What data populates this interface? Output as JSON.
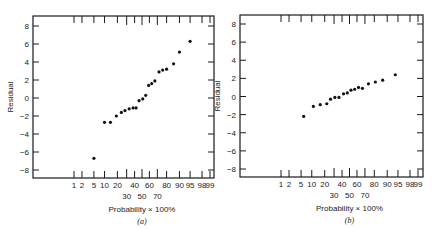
{
  "chart_data": [
    {
      "type": "scatter",
      "panel": "(a)",
      "title": "",
      "xlabel": "Probability × 100%",
      "ylabel": "Residual",
      "x_scale": "normal-probability",
      "ylim": [
        -9,
        9
      ],
      "y_ticks": [
        8,
        6,
        4,
        2,
        0,
        -2,
        -4,
        -6,
        -8
      ],
      "x_ticks_row1": [
        "1",
        "2",
        "5",
        "10",
        "20",
        "40",
        "60",
        "80",
        "90",
        "95",
        "98",
        "99"
      ],
      "x_ticks_row2": [
        "30",
        "50",
        "70"
      ],
      "grid": false,
      "points": [
        {
          "p": 5,
          "residual": -6.7
        },
        {
          "p": 10,
          "residual": -2.7
        },
        {
          "p": 14,
          "residual": -2.7
        },
        {
          "p": 19,
          "residual": -2.0
        },
        {
          "p": 24,
          "residual": -1.6
        },
        {
          "p": 28,
          "residual": -1.4
        },
        {
          "p": 33,
          "residual": -1.2
        },
        {
          "p": 38,
          "residual": -1.1
        },
        {
          "p": 42,
          "residual": -1.1
        },
        {
          "p": 46,
          "residual": -0.3
        },
        {
          "p": 51,
          "residual": -0.1
        },
        {
          "p": 55,
          "residual": 0.3
        },
        {
          "p": 59,
          "residual": 1.4
        },
        {
          "p": 63,
          "residual": 1.6
        },
        {
          "p": 67,
          "residual": 1.9
        },
        {
          "p": 72,
          "residual": 2.9
        },
        {
          "p": 76,
          "residual": 3.1
        },
        {
          "p": 80,
          "residual": 3.2
        },
        {
          "p": 86,
          "residual": 3.8
        },
        {
          "p": 90,
          "residual": 5.1
        },
        {
          "p": 95,
          "residual": 6.3
        }
      ]
    },
    {
      "type": "scatter",
      "panel": "(b)",
      "title": "",
      "xlabel": "Probability × 100%",
      "ylabel": "Residual",
      "x_scale": "normal-probability",
      "ylim": [
        -9,
        9
      ],
      "y_ticks": [
        8,
        6,
        4,
        2,
        0,
        -2,
        -4,
        -6,
        -8
      ],
      "x_ticks_row1": [
        "1",
        "2",
        "5",
        "10",
        "20",
        "40",
        "60",
        "80",
        "90",
        "95",
        "98",
        "99"
      ],
      "x_ticks_row2": [
        "30",
        "50",
        "70"
      ],
      "grid": false,
      "points": [
        {
          "p": 6,
          "residual": -2.2
        },
        {
          "p": 11,
          "residual": -1.1
        },
        {
          "p": 16,
          "residual": -0.9
        },
        {
          "p": 22,
          "residual": -0.8
        },
        {
          "p": 26,
          "residual": -0.3
        },
        {
          "p": 31,
          "residual": -0.1
        },
        {
          "p": 36,
          "residual": -0.1
        },
        {
          "p": 42,
          "residual": 0.3
        },
        {
          "p": 47,
          "residual": 0.4
        },
        {
          "p": 52,
          "residual": 0.7
        },
        {
          "p": 57,
          "residual": 0.8
        },
        {
          "p": 62,
          "residual": 1.0
        },
        {
          "p": 67,
          "residual": 0.9
        },
        {
          "p": 74,
          "residual": 1.4
        },
        {
          "p": 81,
          "residual": 1.6
        },
        {
          "p": 87,
          "residual": 1.8
        },
        {
          "p": 94,
          "residual": 2.4
        }
      ]
    }
  ],
  "panels": [
    {
      "caption": "(a)",
      "xlabel": "Probability × 100%",
      "ylabel": "Residual"
    },
    {
      "caption": "(b)",
      "xlabel": "Probability × 100%",
      "ylabel": "Residual"
    }
  ]
}
